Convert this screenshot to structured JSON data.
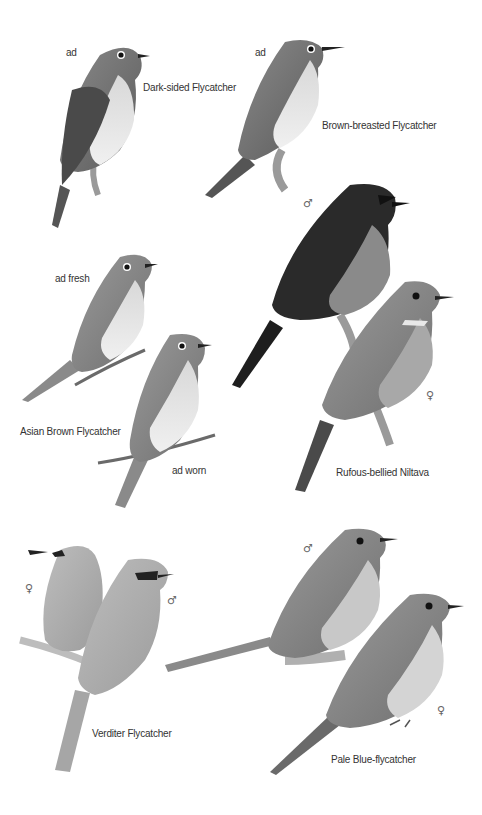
{
  "plate": {
    "species": [
      {
        "name": "Dark-sided Flycatcher",
        "figures": [
          {
            "age_label": "ad"
          }
        ]
      },
      {
        "name": "Brown-breasted Flycatcher",
        "figures": [
          {
            "age_label": "ad"
          }
        ]
      },
      {
        "name": "Asian Brown Flycatcher",
        "figures": [
          {
            "age_label": "ad fresh"
          },
          {
            "age_label": "ad worn"
          }
        ]
      },
      {
        "name": "Rufous-bellied Niltava",
        "figures": [
          {
            "sex": "♂"
          },
          {
            "sex": "♀"
          }
        ]
      },
      {
        "name": "Verditer Flycatcher",
        "figures": [
          {
            "sex": "♀"
          },
          {
            "sex": "♂"
          }
        ]
      },
      {
        "name": "Pale Blue-flycatcher",
        "figures": [
          {
            "sex": "♂"
          },
          {
            "sex": "♀"
          }
        ]
      }
    ]
  }
}
